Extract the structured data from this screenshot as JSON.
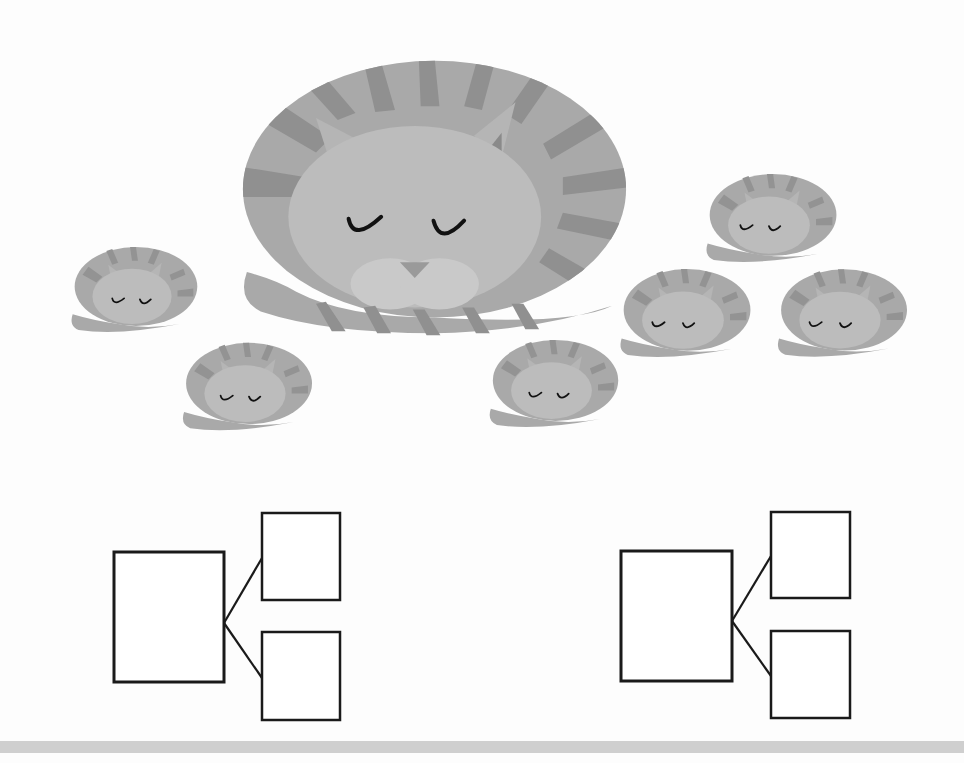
{
  "worksheet": {
    "caption": "Sleeping cats: 1 big cat and 6 small cats; fill in the number bonds",
    "colors": {
      "cat_body": "#a9a9a9",
      "cat_stripe": "#8f8f8f",
      "cat_face": "#bdbdbd",
      "cat_muzzle": "#cacaca",
      "cat_ear_inner": "#8a8a8a",
      "cat_eye": "#111111",
      "box_stroke": "#1a1a1a",
      "bottom_bar": "#cfcfcf"
    },
    "big_cat": {
      "label": "big-cat",
      "x": 237,
      "y": 57,
      "w": 395,
      "h": 280
    },
    "small_cats": [
      {
        "label": "small-cat-1",
        "x": 67,
        "y": 245,
        "w": 132,
        "h": 89
      },
      {
        "label": "small-cat-2",
        "x": 180,
        "y": 340,
        "w": 132,
        "h": 93
      },
      {
        "label": "small-cat-3",
        "x": 486,
        "y": 338,
        "w": 133,
        "h": 91
      },
      {
        "label": "small-cat-4",
        "x": 703,
        "y": 172,
        "w": 134,
        "h": 92
      },
      {
        "label": "small-cat-5",
        "x": 617,
        "y": 267,
        "w": 134,
        "h": 92
      },
      {
        "label": "small-cat-6",
        "x": 775,
        "y": 267,
        "w": 132,
        "h": 92
      }
    ],
    "number_bonds": [
      {
        "label": "number-bond-left",
        "whole_box": {
          "x": 114,
          "y": 552,
          "w": 110,
          "h": 130,
          "value": ""
        },
        "part_boxes": [
          {
            "x": 262,
            "y": 513,
            "w": 78,
            "h": 87,
            "value": ""
          },
          {
            "x": 262,
            "y": 632,
            "w": 78,
            "h": 88,
            "value": ""
          }
        ]
      },
      {
        "label": "number-bond-right",
        "whole_box": {
          "x": 621,
          "y": 551,
          "w": 111,
          "h": 130,
          "value": ""
        },
        "part_boxes": [
          {
            "x": 771,
            "y": 512,
            "w": 79,
            "h": 86,
            "value": ""
          },
          {
            "x": 771,
            "y": 631,
            "w": 79,
            "h": 87,
            "value": ""
          }
        ]
      }
    ]
  }
}
